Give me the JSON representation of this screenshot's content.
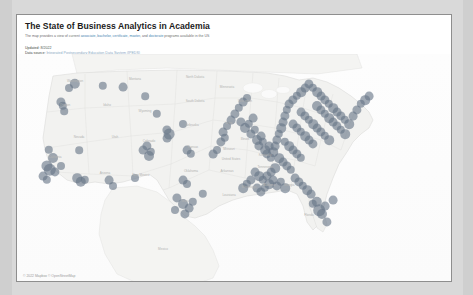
{
  "document": {
    "title": "The State of Business Analytics in Academia",
    "subtitle_prefix": "The map provides a view of current ",
    "subtitle_kw1": "associate, bachelor, certificate, master",
    "subtitle_mid": ", and ",
    "subtitle_kw2": "doctorate",
    "subtitle_suffix": " programs available in the US",
    "meta": [
      {
        "label": "Updated:",
        "value": " 8/2022",
        "link": ""
      },
      {
        "label": "Data source:",
        "value": " ",
        "link": "Integrated Postsecondary Education Data System (IPEDS)"
      }
    ]
  },
  "map": {
    "name": "us-programs-map",
    "attribution": "© 2022 Mapbox © OpenStreetMap",
    "marker_color": "#687688",
    "marker_opacity": 0.62,
    "land_color": "#f2f2f0",
    "water_color": "#fdfdfd",
    "border_color": "#dcdcda",
    "labels": [
      {
        "text": "Washington",
        "x": 58,
        "y": 28
      },
      {
        "text": "Montana",
        "x": 118,
        "y": 26
      },
      {
        "text": "North Dakota",
        "x": 178,
        "y": 24
      },
      {
        "text": "Minnesota",
        "x": 210,
        "y": 34
      },
      {
        "text": "Oregon",
        "x": 48,
        "y": 52
      },
      {
        "text": "Idaho",
        "x": 90,
        "y": 52
      },
      {
        "text": "Wyoming",
        "x": 128,
        "y": 58
      },
      {
        "text": "South Dakota",
        "x": 178,
        "y": 48
      },
      {
        "text": "Wisconsin",
        "x": 228,
        "y": 48
      },
      {
        "text": "Nebraska",
        "x": 175,
        "y": 72
      },
      {
        "text": "Iowa",
        "x": 212,
        "y": 70
      },
      {
        "text": "Nevada",
        "x": 62,
        "y": 84
      },
      {
        "text": "Utah",
        "x": 98,
        "y": 84
      },
      {
        "text": "Colorado",
        "x": 132,
        "y": 88
      },
      {
        "text": "Illinois",
        "x": 228,
        "y": 86
      },
      {
        "text": "Kansas",
        "x": 176,
        "y": 94
      },
      {
        "text": "Missouri",
        "x": 212,
        "y": 96
      },
      {
        "text": "California",
        "x": 38,
        "y": 104
      },
      {
        "text": "Kentucky",
        "x": 248,
        "y": 102
      },
      {
        "text": "Arizona",
        "x": 88,
        "y": 120
      },
      {
        "text": "New Mexico",
        "x": 124,
        "y": 122
      },
      {
        "text": "Oklahoma",
        "x": 174,
        "y": 118
      },
      {
        "text": "Arkansas",
        "x": 210,
        "y": 118
      },
      {
        "text": "Tennessee",
        "x": 248,
        "y": 114
      },
      {
        "text": "United States",
        "x": 214,
        "y": 106
      },
      {
        "text": "Texas",
        "x": 168,
        "y": 148
      },
      {
        "text": "Louisiana",
        "x": 212,
        "y": 142
      },
      {
        "text": "Mississippi",
        "x": 232,
        "y": 134
      },
      {
        "text": "Alabama",
        "x": 252,
        "y": 132
      },
      {
        "text": "Georgia",
        "x": 272,
        "y": 132
      },
      {
        "text": "Florida",
        "x": 292,
        "y": 162
      },
      {
        "text": "Mexico",
        "x": 146,
        "y": 196
      }
    ]
  },
  "chart_data": {
    "type": "scatter",
    "title": "The State of Business Analytics in Academia",
    "subtitle": "The map provides a view of current associate, bachelor, certificate, master, and doctorate programs available in the US",
    "projection": "web-mercator",
    "region": "United States (contiguous) with parts of Canada and Mexico",
    "xlabel": "longitude",
    "ylabel": "latitude",
    "marker_shape": "circle",
    "marker_color": "#687688",
    "marker_opacity": 0.62,
    "point_count": 152,
    "density_by_region": [
      {
        "region": "Northeast",
        "approx_points": 48
      },
      {
        "region": "Midwest / Great Lakes",
        "approx_points": 38
      },
      {
        "region": "Southeast",
        "approx_points": 30
      },
      {
        "region": "West Coast",
        "approx_points": 16
      },
      {
        "region": "Mountain West",
        "approx_points": 10
      },
      {
        "region": "South Central",
        "approx_points": 10
      }
    ],
    "points": [
      [
        58,
        30,
        5.2
      ],
      [
        52,
        34,
        4.0
      ],
      [
        44,
        48,
        4.6
      ],
      [
        46,
        52,
        4.2
      ],
      [
        47,
        57,
        3.8
      ],
      [
        86,
        32,
        4.2
      ],
      [
        106,
        33,
        4.4
      ],
      [
        128,
        42,
        3.8
      ],
      [
        140,
        60,
        4.2
      ],
      [
        150,
        76,
        4.6
      ],
      [
        152,
        80,
        5.4
      ],
      [
        150,
        84,
        4.4
      ],
      [
        32,
        96,
        4.2
      ],
      [
        36,
        104,
        5.0
      ],
      [
        30,
        112,
        5.6
      ],
      [
        33,
        116,
        6.2
      ],
      [
        38,
        118,
        4.6
      ],
      [
        44,
        112,
        4.0
      ],
      [
        26,
        122,
        4.4
      ],
      [
        30,
        126,
        4.2
      ],
      [
        62,
        96,
        3.8
      ],
      [
        60,
        124,
        4.8
      ],
      [
        64,
        128,
        5.2
      ],
      [
        68,
        126,
        4.2
      ],
      [
        92,
        126,
        4.4
      ],
      [
        96,
        132,
        4.0
      ],
      [
        118,
        124,
        4.0
      ],
      [
        126,
        96,
        4.4
      ],
      [
        130,
        92,
        4.6
      ],
      [
        134,
        98,
        4.2
      ],
      [
        132,
        102,
        5.0
      ],
      [
        166,
        70,
        4.0
      ],
      [
        170,
        96,
        4.4
      ],
      [
        174,
        100,
        4.2
      ],
      [
        166,
        126,
        4.4
      ],
      [
        170,
        130,
        4.0
      ],
      [
        160,
        144,
        4.6
      ],
      [
        166,
        150,
        5.0
      ],
      [
        172,
        154,
        4.4
      ],
      [
        176,
        148,
        4.2
      ],
      [
        168,
        160,
        4.6
      ],
      [
        158,
        156,
        4.0
      ],
      [
        186,
        140,
        4.2
      ],
      [
        196,
        100,
        4.4
      ],
      [
        200,
        96,
        4.0
      ],
      [
        204,
        88,
        4.6
      ],
      [
        208,
        84,
        4.2
      ],
      [
        206,
        78,
        4.4
      ],
      [
        210,
        72,
        4.0
      ],
      [
        214,
        66,
        4.4
      ],
      [
        218,
        60,
        4.6
      ],
      [
        222,
        54,
        4.2
      ],
      [
        226,
        48,
        4.4
      ],
      [
        230,
        44,
        4.0
      ],
      [
        224,
        68,
        4.6
      ],
      [
        228,
        74,
        5.0
      ],
      [
        232,
        70,
        4.2
      ],
      [
        236,
        64,
        4.4
      ],
      [
        234,
        80,
        4.6
      ],
      [
        238,
        76,
        4.2
      ],
      [
        240,
        86,
        5.0
      ],
      [
        244,
        82,
        4.4
      ],
      [
        242,
        92,
        4.6
      ],
      [
        246,
        88,
        4.2
      ],
      [
        248,
        96,
        4.8
      ],
      [
        252,
        92,
        4.4
      ],
      [
        250,
        100,
        4.6
      ],
      [
        254,
        104,
        4.2
      ],
      [
        256,
        98,
        4.8
      ],
      [
        258,
        92,
        4.4
      ],
      [
        260,
        86,
        4.6
      ],
      [
        262,
        80,
        4.2
      ],
      [
        264,
        74,
        4.8
      ],
      [
        266,
        68,
        4.4
      ],
      [
        268,
        62,
        4.6
      ],
      [
        270,
        56,
        4.2
      ],
      [
        272,
        50,
        4.4
      ],
      [
        276,
        46,
        4.6
      ],
      [
        280,
        42,
        4.2
      ],
      [
        284,
        38,
        4.8
      ],
      [
        288,
        34,
        4.4
      ],
      [
        292,
        30,
        4.6
      ],
      [
        296,
        34,
        4.2
      ],
      [
        300,
        38,
        4.8
      ],
      [
        304,
        42,
        4.4
      ],
      [
        308,
        46,
        4.6
      ],
      [
        312,
        50,
        4.2
      ],
      [
        316,
        54,
        4.8
      ],
      [
        320,
        58,
        4.4
      ],
      [
        324,
        62,
        4.6
      ],
      [
        328,
        66,
        4.2
      ],
      [
        332,
        70,
        4.8
      ],
      [
        336,
        62,
        4.4
      ],
      [
        340,
        56,
        4.6
      ],
      [
        344,
        50,
        4.2
      ],
      [
        348,
        46,
        4.8
      ],
      [
        352,
        42,
        4.4
      ],
      [
        300,
        52,
        5.0
      ],
      [
        304,
        56,
        4.6
      ],
      [
        308,
        60,
        4.2
      ],
      [
        312,
        64,
        4.8
      ],
      [
        316,
        68,
        4.4
      ],
      [
        320,
        72,
        4.6
      ],
      [
        324,
        76,
        4.2
      ],
      [
        328,
        80,
        4.8
      ],
      [
        284,
        58,
        4.4
      ],
      [
        288,
        62,
        4.6
      ],
      [
        292,
        66,
        4.2
      ],
      [
        296,
        70,
        4.8
      ],
      [
        300,
        74,
        4.4
      ],
      [
        304,
        78,
        4.6
      ],
      [
        308,
        82,
        4.2
      ],
      [
        312,
        86,
        4.8
      ],
      [
        276,
        70,
        4.4
      ],
      [
        280,
        74,
        4.6
      ],
      [
        284,
        78,
        4.2
      ],
      [
        288,
        82,
        4.8
      ],
      [
        292,
        86,
        4.4
      ],
      [
        296,
        90,
        4.6
      ],
      [
        268,
        88,
        4.2
      ],
      [
        272,
        92,
        4.8
      ],
      [
        276,
        96,
        4.4
      ],
      [
        280,
        100,
        4.6
      ],
      [
        284,
        104,
        4.2
      ],
      [
        262,
        104,
        4.8
      ],
      [
        266,
        108,
        4.4
      ],
      [
        270,
        112,
        4.6
      ],
      [
        274,
        116,
        4.2
      ],
      [
        258,
        114,
        4.8
      ],
      [
        254,
        118,
        4.4
      ],
      [
        250,
        122,
        4.6
      ],
      [
        246,
        126,
        4.2
      ],
      [
        242,
        122,
        4.8
      ],
      [
        238,
        118,
        4.4
      ],
      [
        234,
        126,
        4.6
      ],
      [
        230,
        130,
        4.2
      ],
      [
        226,
        134,
        4.8
      ],
      [
        240,
        134,
        4.4
      ],
      [
        244,
        138,
        4.6
      ],
      [
        248,
        134,
        4.2
      ],
      [
        252,
        130,
        4.8
      ],
      [
        256,
        126,
        4.4
      ],
      [
        260,
        132,
        4.6
      ],
      [
        264,
        128,
        4.2
      ],
      [
        268,
        134,
        4.8
      ],
      [
        278,
        124,
        4.4
      ],
      [
        282,
        128,
        4.6
      ],
      [
        286,
        132,
        4.2
      ],
      [
        290,
        136,
        4.8
      ],
      [
        294,
        140,
        4.4
      ],
      [
        300,
        148,
        5.2
      ],
      [
        302,
        156,
        5.8
      ],
      [
        305,
        160,
        5.0
      ],
      [
        308,
        152,
        4.4
      ],
      [
        310,
        168,
        4.6
      ],
      [
        296,
        150,
        4.2
      ],
      [
        316,
        146,
        4.4
      ]
    ]
  }
}
